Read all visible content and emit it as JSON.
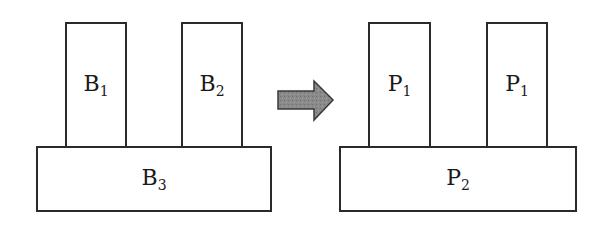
{
  "before": {
    "top_blocks": [
      {
        "letter": "B",
        "index": "1"
      },
      {
        "letter": "B",
        "index": "2"
      }
    ],
    "base_block": {
      "letter": "B",
      "index": "3"
    }
  },
  "arrow": {
    "icon": "right-arrow-icon",
    "color": "#808080"
  },
  "after": {
    "top_blocks": [
      {
        "letter": "P",
        "index": "1"
      },
      {
        "letter": "P",
        "index": "1"
      }
    ],
    "base_block": {
      "letter": "P",
      "index": "2"
    }
  }
}
